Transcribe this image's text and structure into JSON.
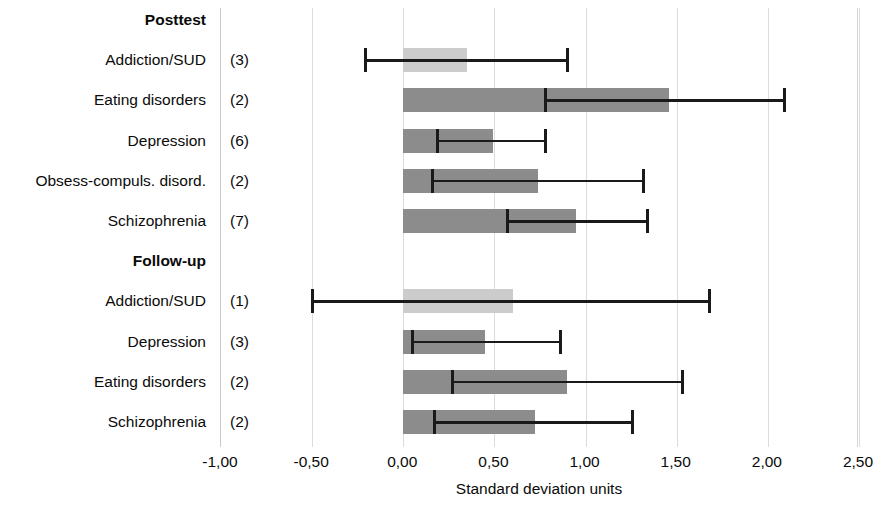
{
  "chart_data": {
    "type": "bar",
    "orientation": "horizontal",
    "title": "",
    "xlabel": "Standard deviation units",
    "ylabel": "",
    "xlim": [
      -1.0,
      2.5
    ],
    "xticks": [
      -1.0,
      -0.5,
      0.0,
      0.5,
      1.0,
      1.5,
      2.0,
      2.5
    ],
    "xticklabels": [
      "-1,00",
      "-0,50",
      "0,00",
      "0,50",
      "1,00",
      "1,50",
      "2,00",
      "2,50"
    ],
    "grid": "vertical",
    "legend": "none",
    "colors": {
      "bar_dark": "#8c8c8c",
      "bar_light": "#cccccc",
      "error_bar": "#1a1a1a",
      "gridline": "#dcdcdc"
    },
    "groups": [
      {
        "name": "Posttest",
        "rows": [
          {
            "label": "Addiction/SUD",
            "count": "(3)",
            "value": 0.35,
            "ci_low": -0.21,
            "ci_high": 0.9,
            "shade": "light"
          },
          {
            "label": "Eating disorders",
            "count": "(2)",
            "value": 1.46,
            "ci_low": 0.78,
            "ci_high": 2.09,
            "shade": "dark"
          },
          {
            "label": "Depression",
            "count": "(6)",
            "value": 0.49,
            "ci_low": 0.19,
            "ci_high": 0.78,
            "shade": "dark"
          },
          {
            "label": "Obsess-compuls. disord.",
            "count": "(2)",
            "value": 0.74,
            "ci_low": 0.16,
            "ci_high": 1.32,
            "shade": "dark"
          },
          {
            "label": "Schizophrenia",
            "count": "(7)",
            "value": 0.95,
            "ci_low": 0.57,
            "ci_high": 1.34,
            "shade": "dark"
          }
        ]
      },
      {
        "name": "Follow-up",
        "rows": [
          {
            "label": "Addiction/SUD",
            "count": "(1)",
            "value": 0.6,
            "ci_low": -0.5,
            "ci_high": 1.68,
            "shade": "light"
          },
          {
            "label": "Depression",
            "count": "(3)",
            "value": 0.45,
            "ci_low": 0.05,
            "ci_high": 0.86,
            "shade": "dark"
          },
          {
            "label": "Eating disorders",
            "count": "(2)",
            "value": 0.9,
            "ci_low": 0.27,
            "ci_high": 1.53,
            "shade": "dark"
          },
          {
            "label": "Schizophrenia",
            "count": "(2)",
            "value": 0.72,
            "ci_low": 0.17,
            "ci_high": 1.26,
            "shade": "dark"
          }
        ]
      }
    ]
  },
  "axis": {
    "title": "Standard deviation units"
  },
  "rows": [
    {
      "label": "Posttest",
      "count": "",
      "header": true
    },
    {
      "label": "Addiction/SUD",
      "count": "(3)",
      "header": false
    },
    {
      "label": "Eating disorders",
      "count": "(2)",
      "header": false
    },
    {
      "label": "Depression",
      "count": "(6)",
      "header": false
    },
    {
      "label": "Obsess-compuls. disord.",
      "count": "(2)",
      "header": false
    },
    {
      "label": "Schizophrenia",
      "count": "(7)",
      "header": false
    },
    {
      "label": "Follow-up",
      "count": "",
      "header": true
    },
    {
      "label": "Addiction/SUD",
      "count": "(1)",
      "header": false
    },
    {
      "label": "Depression",
      "count": "(3)",
      "header": false
    },
    {
      "label": "Eating disorders",
      "count": "(2)",
      "header": false
    },
    {
      "label": "Schizophrenia",
      "count": "(2)",
      "header": false
    }
  ]
}
